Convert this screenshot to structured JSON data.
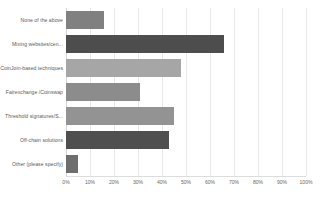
{
  "chart_data": {
    "type": "bar",
    "orientation": "horizontal",
    "title": "",
    "xlabel": "",
    "ylabel": "",
    "xlim": [
      0,
      100
    ],
    "xtick_labels": [
      "0%",
      "10%",
      "20%",
      "30%",
      "40%",
      "50%",
      "60%",
      "70%",
      "80%",
      "90%",
      "100%"
    ],
    "xtick_values": [
      0,
      10,
      20,
      30,
      40,
      50,
      60,
      70,
      80,
      90,
      100
    ],
    "grid": true,
    "legend": false,
    "value_suffix": "%",
    "categories": [
      "None of the above",
      "Mixing websites/cen...",
      "CoinJoin-based techniques",
      "Fairexchange /Coinswap",
      "Threshold signatures/S...",
      "Off-chain solutions",
      "Other (please specify)"
    ],
    "values": [
      16,
      66,
      48,
      31,
      45,
      43,
      5
    ],
    "bar_colors": [
      "#808080",
      "#4d4d4d",
      "#a6a6a6",
      "#8c8c8c",
      "#939393",
      "#4f4f4f",
      "#6e6e6e"
    ],
    "colors": {
      "grid": "#e9e9e9",
      "axis": "#d6d6d6",
      "text": "#595959",
      "background": "#ffffff"
    }
  }
}
